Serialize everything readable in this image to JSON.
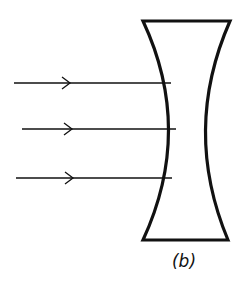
{
  "figure": {
    "label": "(b)"
  },
  "lens": {
    "type": "biconcave",
    "stroke_color": "#111111",
    "top_left": [
      143,
      21
    ],
    "top_right": [
      230,
      21
    ],
    "bottom_left": [
      143,
      240
    ],
    "bottom_right": [
      228,
      240
    ],
    "waist_left_x": 176,
    "waist_right_x": 197,
    "waist_y": 130
  },
  "rays": [
    {
      "start": [
        14,
        83
      ],
      "end": [
        171,
        83
      ],
      "arrow_x": 70
    },
    {
      "start": [
        22,
        129
      ],
      "end": [
        176,
        129
      ],
      "arrow_x": 72
    },
    {
      "start": [
        16,
        178
      ],
      "end": [
        172,
        178
      ],
      "arrow_x": 73
    }
  ],
  "colors": {
    "ink": "#111111",
    "background": "#ffffff"
  }
}
